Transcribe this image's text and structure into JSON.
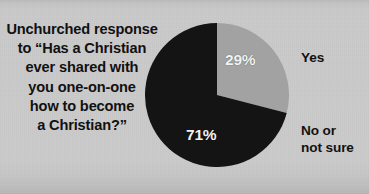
{
  "figure": {
    "title": "Unchurched response\nto “Has a Christian\never shared with\nyou one-on-one\nhow to become\na Christian?”",
    "background_color": "#c7c7c7"
  },
  "labels": {
    "yes": "Yes",
    "no_or_not_sure": "No or\nnot sure"
  },
  "chart_data": {
    "type": "pie",
    "title": "Unchurched response to “Has a Christian ever shared with you one-on-one how to become a Christian?”",
    "categories": [
      "Yes",
      "No or not sure"
    ],
    "values": [
      29,
      71
    ],
    "value_labels": [
      "29%",
      "71%"
    ],
    "unit": "percent",
    "colors": [
      "#a2a2a2",
      "#141414"
    ],
    "label_colors": [
      "#f2f2f2",
      "#f2f2f2"
    ],
    "start_angle_deg": 0,
    "direction": "clockwise",
    "legend": "outside-right",
    "grid": false,
    "xlabel": "",
    "ylabel": ""
  },
  "geometry": {
    "center_x": 217,
    "center_y": 95,
    "radius": 72
  }
}
